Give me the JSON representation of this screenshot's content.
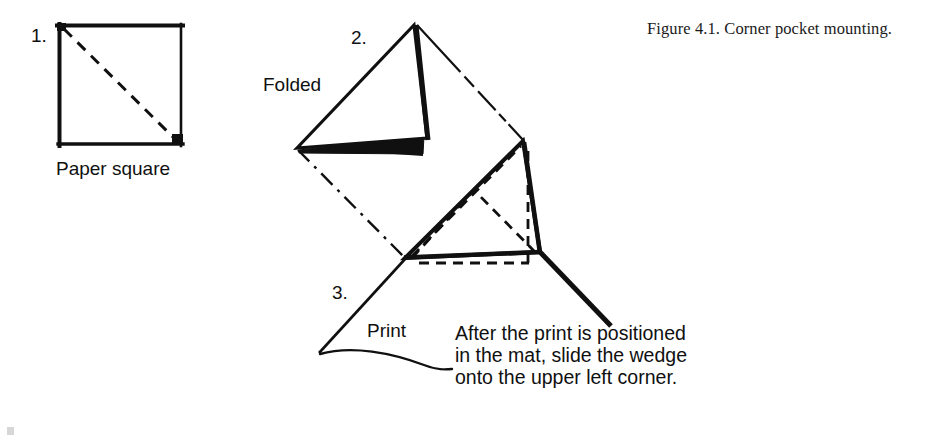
{
  "figure": {
    "caption": "Figure 4.1.  Corner pocket mounting.",
    "background_color": "#ffffff",
    "ink_color": "#101010"
  },
  "steps": [
    {
      "number": "1.",
      "label": "Paper square",
      "description": "square with dashed diagonal fold line"
    },
    {
      "number": "2.",
      "label": "Folded",
      "description": "paper square folded into a triangular wedge"
    },
    {
      "number": "3.",
      "label": "Print",
      "description": "wedge slid onto the upper left corner of the print in the mat"
    }
  ],
  "instruction": {
    "line1": "After the print is positioned",
    "line2": "in the mat, slide the wedge",
    "line3": "onto the upper left corner."
  },
  "geometry": {
    "square": {
      "x": 58,
      "y": 24,
      "w": 124,
      "h": 121
    },
    "wedge_apex": "415,24",
    "wedge_left": "297,148",
    "pocket_corner": "405,258"
  }
}
